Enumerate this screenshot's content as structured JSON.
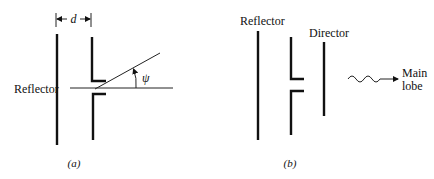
{
  "figure": {
    "panel_a": {
      "caption": "(a)",
      "reflector_label": "Reflector",
      "dimension_label": "d",
      "angle_label": "ψ",
      "elements": [
        "reflector",
        "driven-dipole"
      ]
    },
    "panel_b": {
      "caption": "(b)",
      "reflector_label": "Reflector",
      "director_label": "Director",
      "main_lobe_label_line1": "Main",
      "main_lobe_label_line2": "lobe",
      "elements": [
        "reflector",
        "driven-dipole",
        "director"
      ]
    }
  }
}
